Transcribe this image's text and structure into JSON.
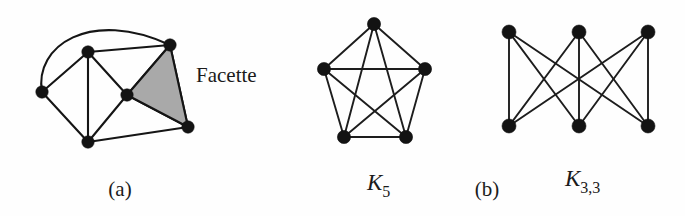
{
  "figure": {
    "background_color": "#fefefe",
    "ink_color": "#131313",
    "face_fill_color": "#a9a9a9",
    "annotations": {
      "facette_label": "Facette",
      "caption_a": "(a)",
      "caption_b": "(b)"
    },
    "panels": [
      {
        "id": "panel-a",
        "caption": "(a)",
        "caption_pos": {
          "x": 120,
          "y": 196
        },
        "title": "",
        "description": "planar graph with one highlighted face",
        "vertices": [
          {
            "id": "v-left",
            "x": 42,
            "y": 92
          },
          {
            "id": "v-topleft",
            "x": 88,
            "y": 52
          },
          {
            "id": "v-topright",
            "x": 170,
            "y": 45
          },
          {
            "id": "v-center",
            "x": 127,
            "y": 95
          },
          {
            "id": "v-bottom",
            "x": 88,
            "y": 142
          },
          {
            "id": "v-bottomright",
            "x": 188,
            "y": 127
          }
        ],
        "edges": [
          {
            "from": "v-left",
            "to": "v-topleft",
            "curved": false
          },
          {
            "from": "v-left",
            "to": "v-bottom",
            "curved": false
          },
          {
            "from": "v-left",
            "to": "v-topright",
            "curved": true,
            "arc": "over-top"
          },
          {
            "from": "v-topleft",
            "to": "v-topright",
            "curved": false
          },
          {
            "from": "v-topleft",
            "to": "v-center",
            "curved": false
          },
          {
            "from": "v-topleft",
            "to": "v-bottom",
            "curved": false
          },
          {
            "from": "v-center",
            "to": "v-topright",
            "curved": false
          },
          {
            "from": "v-center",
            "to": "v-bottom",
            "curved": false
          },
          {
            "from": "v-center",
            "to": "v-bottomright",
            "curved": false
          },
          {
            "from": "v-bottom",
            "to": "v-bottomright",
            "curved": false
          },
          {
            "from": "v-topright",
            "to": "v-bottomright",
            "curved": false
          }
        ],
        "shaded_face": {
          "label": "Facette",
          "label_pos": {
            "x": 196,
            "y": 82
          },
          "vertices": [
            "v-topright",
            "v-center",
            "v-bottomright"
          ],
          "fill": "#a9a9a9"
        }
      },
      {
        "id": "panel-k5",
        "caption": "",
        "title": "K",
        "subscript": "5",
        "title_pos": {
          "x": 367,
          "y": 190
        },
        "description": "complete graph on 5 vertices",
        "vertices": [
          {
            "id": "k5-top",
            "x": 374,
            "y": 24
          },
          {
            "id": "k5-left",
            "x": 324,
            "y": 69
          },
          {
            "id": "k5-right",
            "x": 425,
            "y": 69
          },
          {
            "id": "k5-bottomleft",
            "x": 344,
            "y": 137
          },
          {
            "id": "k5-bottomright",
            "x": 406,
            "y": 137
          }
        ],
        "edges": [
          {
            "from": "k5-top",
            "to": "k5-left"
          },
          {
            "from": "k5-top",
            "to": "k5-right"
          },
          {
            "from": "k5-top",
            "to": "k5-bottomleft"
          },
          {
            "from": "k5-top",
            "to": "k5-bottomright"
          },
          {
            "from": "k5-left",
            "to": "k5-right"
          },
          {
            "from": "k5-left",
            "to": "k5-bottomleft"
          },
          {
            "from": "k5-left",
            "to": "k5-bottomright"
          },
          {
            "from": "k5-right",
            "to": "k5-bottomleft"
          },
          {
            "from": "k5-right",
            "to": "k5-bottomright"
          },
          {
            "from": "k5-bottomleft",
            "to": "k5-bottomright"
          }
        ]
      },
      {
        "id": "panel-k33",
        "caption": "(b)",
        "caption_pos": {
          "x": 487,
          "y": 196
        },
        "title": "K",
        "subscript": "3,3",
        "title_pos": {
          "x": 565,
          "y": 186
        },
        "description": "complete bipartite graph K3,3",
        "vertices": [
          {
            "id": "k33-t1",
            "x": 509,
            "y": 32
          },
          {
            "id": "k33-t2",
            "x": 579,
            "y": 32
          },
          {
            "id": "k33-t3",
            "x": 648,
            "y": 32
          },
          {
            "id": "k33-b1",
            "x": 509,
            "y": 126
          },
          {
            "id": "k33-b2",
            "x": 579,
            "y": 126
          },
          {
            "id": "k33-b3",
            "x": 648,
            "y": 126
          }
        ],
        "edges": [
          {
            "from": "k33-t1",
            "to": "k33-b1"
          },
          {
            "from": "k33-t1",
            "to": "k33-b2"
          },
          {
            "from": "k33-t1",
            "to": "k33-b3"
          },
          {
            "from": "k33-t2",
            "to": "k33-b1"
          },
          {
            "from": "k33-t2",
            "to": "k33-b2"
          },
          {
            "from": "k33-t2",
            "to": "k33-b3"
          },
          {
            "from": "k33-t3",
            "to": "k33-b1"
          },
          {
            "from": "k33-t3",
            "to": "k33-b2"
          },
          {
            "from": "k33-t3",
            "to": "k33-b3"
          }
        ]
      }
    ]
  }
}
